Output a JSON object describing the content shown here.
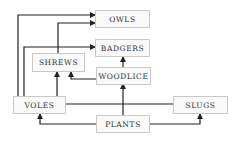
{
  "diagram": {
    "type": "food-web",
    "colors": {
      "line": "#222222",
      "box_border": "#c8c8c8",
      "box_fill": "#fafafa",
      "text": "#333333"
    },
    "nodes": {
      "owls": {
        "label": "OWLS"
      },
      "badgers": {
        "label": "BADGERS"
      },
      "shrews": {
        "label": "SHREWS"
      },
      "woodlice": {
        "label": "WOODLICE"
      },
      "voles": {
        "label": "VOLES"
      },
      "slugs": {
        "label": "SLUGS"
      },
      "plants": {
        "label": "PLANTS"
      }
    },
    "edges": [
      {
        "from": "VOLES",
        "to": "OWLS"
      },
      {
        "from": "SHREWS",
        "to": "OWLS"
      },
      {
        "from": "VOLES",
        "to": "BADGERS"
      },
      {
        "from": "WOODLICE",
        "to": "BADGERS"
      },
      {
        "from": "WOODLICE",
        "to": "SHREWS"
      },
      {
        "from": "SLUGS",
        "to": "SHREWS"
      },
      {
        "from": "PLANTS",
        "to": "WOODLICE"
      },
      {
        "from": "PLANTS",
        "to": "VOLES"
      },
      {
        "from": "PLANTS",
        "to": "SLUGS"
      }
    ]
  }
}
